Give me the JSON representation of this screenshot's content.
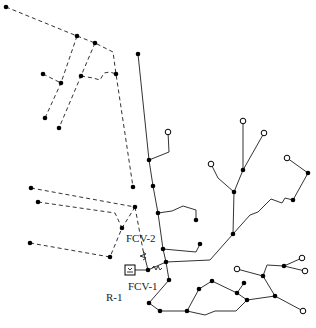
{
  "diagram": {
    "type": "water-distribution-network",
    "colors": {
      "pipe": "#333333",
      "node": "#000000",
      "background": "#ffffff"
    },
    "labels": {
      "fcv2": "FCV-2",
      "fcv1": "FCV-1",
      "reservoir": "R-1"
    },
    "legend_notes": {
      "solid_line": "existing pipe",
      "dashed_line": "pipe (dashed)",
      "filled_circle": "junction",
      "open_circle": "terminal node"
    }
  }
}
